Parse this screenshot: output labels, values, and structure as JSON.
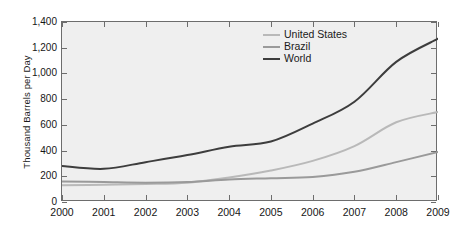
{
  "chart_data": {
    "type": "line",
    "title": "",
    "xlabel": "",
    "ylabel": "Thousand Barrels per Day",
    "x": [
      2000,
      2001,
      2002,
      2003,
      2004,
      2005,
      2006,
      2007,
      2008,
      2009
    ],
    "xtick_labels": [
      "2000",
      "2001",
      "2002",
      "2003",
      "2004",
      "2005",
      "2006",
      "2007",
      "2008",
      "2009"
    ],
    "ytick_labels": [
      "0",
      "200",
      "400",
      "600",
      "800",
      "1,000",
      "1,200",
      "1,400"
    ],
    "ytick_values": [
      0,
      200,
      400,
      600,
      800,
      1000,
      1200,
      1400
    ],
    "ylim": [
      0,
      1400
    ],
    "xlim": [
      2000,
      2009
    ],
    "grid": false,
    "legend_position": "top-right",
    "series": [
      {
        "name": "United States",
        "color": "#b9b9b9",
        "values": [
          130,
          135,
          140,
          150,
          190,
          245,
          320,
          435,
          620,
          700
        ]
      },
      {
        "name": "Brazil",
        "color": "#9a9a9a",
        "values": [
          160,
          155,
          150,
          155,
          175,
          185,
          195,
          235,
          310,
          390
        ]
      },
      {
        "name": "World",
        "color": "#3d3d3d",
        "values": [
          280,
          258,
          310,
          365,
          430,
          470,
          610,
          780,
          1090,
          1270
        ]
      }
    ]
  },
  "legend": {
    "items": [
      {
        "label": "United States",
        "color": "#b9b9b9"
      },
      {
        "label": "Brazil",
        "color": "#9a9a9a"
      },
      {
        "label": "World",
        "color": "#3d3d3d"
      }
    ]
  },
  "colors": {
    "plot_background": "#efefef",
    "page_background": "#ffffff",
    "axis": "#6d6d6d",
    "text": "#161616"
  }
}
